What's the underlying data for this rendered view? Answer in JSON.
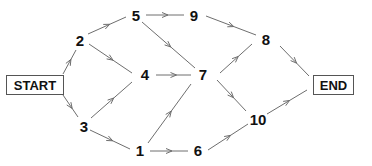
{
  "diagram": {
    "type": "network-activity-graph",
    "start": {
      "id": "START",
      "label": "START",
      "x": 6,
      "y": 75,
      "w": 57,
      "h": 19
    },
    "end": {
      "id": "END",
      "label": "END",
      "x": 313,
      "y": 75,
      "w": 40,
      "h": 19
    },
    "nodes": [
      {
        "id": "1",
        "label": "1",
        "x": 140,
        "y": 150
      },
      {
        "id": "2",
        "label": "2",
        "x": 80,
        "y": 40
      },
      {
        "id": "3",
        "label": "3",
        "x": 84,
        "y": 126
      },
      {
        "id": "4",
        "label": "4",
        "x": 145,
        "y": 74
      },
      {
        "id": "5",
        "label": "5",
        "x": 136,
        "y": 15
      },
      {
        "id": "6",
        "label": "6",
        "x": 198,
        "y": 150
      },
      {
        "id": "7",
        "label": "7",
        "x": 203,
        "y": 74
      },
      {
        "id": "8",
        "label": "8",
        "x": 266,
        "y": 39
      },
      {
        "id": "9",
        "label": "9",
        "x": 194,
        "y": 15
      },
      {
        "id": "10",
        "label": "10",
        "x": 258,
        "y": 119
      }
    ],
    "edges": [
      {
        "from": "START",
        "to": "2",
        "x1": 63,
        "y1": 74,
        "x2": 76,
        "y2": 50
      },
      {
        "from": "START",
        "to": "3",
        "x1": 63,
        "y1": 95,
        "x2": 78,
        "y2": 117
      },
      {
        "from": "2",
        "to": "5",
        "x1": 88,
        "y1": 34,
        "x2": 126,
        "y2": 17
      },
      {
        "from": "2",
        "to": "4",
        "x1": 89,
        "y1": 44,
        "x2": 132,
        "y2": 73
      },
      {
        "from": "3",
        "to": "4",
        "x1": 91,
        "y1": 118,
        "x2": 132,
        "y2": 82
      },
      {
        "from": "3",
        "to": "1",
        "x1": 90,
        "y1": 130,
        "x2": 130,
        "y2": 149
      },
      {
        "from": "5",
        "to": "9",
        "x1": 146,
        "y1": 15,
        "x2": 184,
        "y2": 15
      },
      {
        "from": "5",
        "to": "7",
        "x1": 142,
        "y1": 22,
        "x2": 195,
        "y2": 68
      },
      {
        "from": "4",
        "to": "7",
        "x1": 156,
        "y1": 75,
        "x2": 191,
        "y2": 75
      },
      {
        "from": "1",
        "to": "7",
        "x1": 148,
        "y1": 143,
        "x2": 191,
        "y2": 84
      },
      {
        "from": "1",
        "to": "6",
        "x1": 150,
        "y1": 151,
        "x2": 188,
        "y2": 151
      },
      {
        "from": "9",
        "to": "8",
        "x1": 206,
        "y1": 16,
        "x2": 256,
        "y2": 35
      },
      {
        "from": "7",
        "to": "8",
        "x1": 220,
        "y1": 73,
        "x2": 252,
        "y2": 44
      },
      {
        "from": "7",
        "to": "10",
        "x1": 217,
        "y1": 80,
        "x2": 246,
        "y2": 111
      },
      {
        "from": "6",
        "to": "10",
        "x1": 208,
        "y1": 150,
        "x2": 248,
        "y2": 124
      },
      {
        "from": "8",
        "to": "END",
        "x1": 280,
        "y1": 46,
        "x2": 309,
        "y2": 76
      },
      {
        "from": "10",
        "to": "END",
        "x1": 267,
        "y1": 114,
        "x2": 307,
        "y2": 90
      }
    ],
    "colors": {
      "edge": "#6e6e6e",
      "text": "#111111",
      "box_border": "#555555",
      "background": "#ffffff"
    }
  }
}
